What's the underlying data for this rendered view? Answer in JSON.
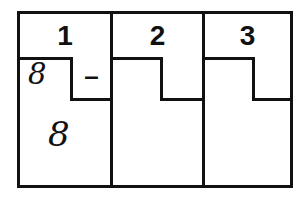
{
  "worksheet": {
    "title": "Three column subtraction worksheet grid",
    "ink_color": "#111111",
    "paper_color": "#ffffff",
    "columns": [
      {
        "header": "1",
        "subbox_mark": "–",
        "subbox_empty": false,
        "answer_top": "8",
        "answer_bottom": "8"
      },
      {
        "header": "2",
        "subbox_mark": "",
        "subbox_empty": true,
        "answer_top": "",
        "answer_bottom": ""
      },
      {
        "header": "3",
        "subbox_mark": "",
        "subbox_empty": true,
        "answer_top": "",
        "answer_bottom": ""
      }
    ]
  }
}
